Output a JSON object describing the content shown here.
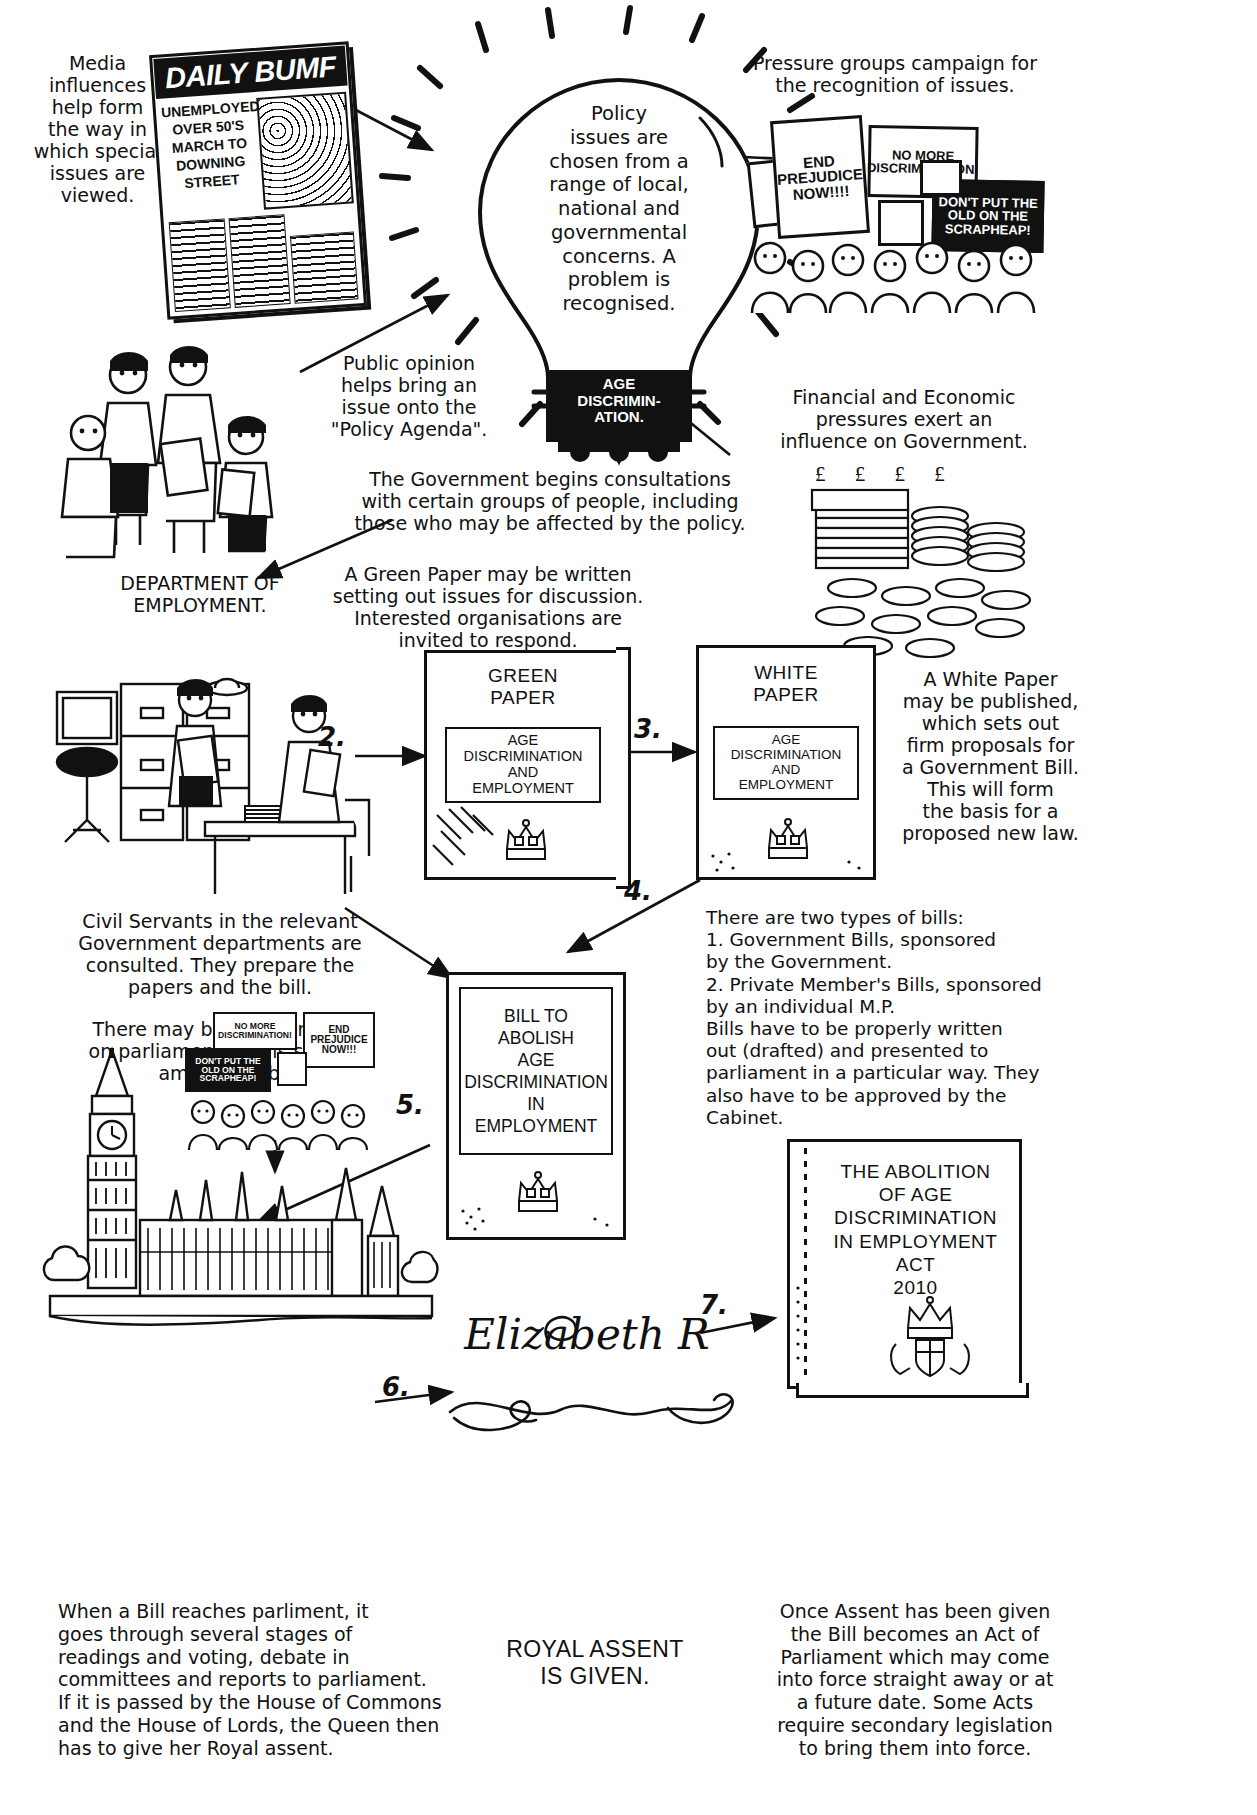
{
  "annotations": {
    "media": "Media\ninfluences\nhelp form\nthe way in\nwhich special\nissues are\nviewed.",
    "pressure_groups": "Pressure groups campaign for\nthe recognition of issues.",
    "public_opinion": "Public opinion\nhelps bring an\nissue onto the\n\"Policy Agenda\".",
    "financial": "Financial and Economic\npressures exert an\ninfluence on Government.",
    "dept_employment": "DEPARTMENT OF\nEMPLOYMENT.",
    "consultations": "The Government begins consultations\nwith certain groups of people, including\nthose who may be affected by the policy.",
    "green_paper_note": "A Green Paper may be written\nsetting out issues for discussion.\nInterested organisations are\ninvited to respond.",
    "white_paper_note": "A White Paper\nmay be published,\nwhich sets out\nfirm proposals for\na Government Bill.\nThis will form\nthe basis for a\nproposed new law.",
    "civil_servants": "Civil Servants in the relevant\nGovernment departments are\nconsulted. They prepare the\npapers and the bill.",
    "more_pressure": "There may be more pressure\non parliament at this stage to\namend the bill.",
    "types_of_bills": "There are two types of bills:\n1. Government Bills, sponsored\nby the Government.\n2. Private Member's Bills, sponsored\nby an individual M.P.\nBills have to be properly written\nout (drafted) and presented to\nparliament in a particular way. They\nalso have to be approved by the\nCabinet.",
    "parliament_stages": "When a Bill reaches parliment, it\ngoes through several stages of\nreadings and voting, debate in\ncommittees and reports to parliament.\nIf it is passed by the House of Commons\nand the House of Lords, the Queen then\nhas to give her Royal assent.",
    "royal_assent_caption": "ROYAL ASSENT\nIS GIVEN.",
    "after_assent": "Once Assent has been given\nthe Bill becomes an Act of\nParliament which may come\ninto force straight away or at\na future date. Some Acts\nrequire secondary legislation\nto bring them into force."
  },
  "lightbulb": {
    "body_text": "Policy\nissues are\nchosen from a\nrange of local,\nnational and\ngovernmental\nconcerns. A\nproblem is\nrecognised.",
    "base_text": "AGE\nDISCRIMIN-\nATION."
  },
  "newspaper": {
    "masthead": "DAILY BUMF",
    "headline": "UNEMPLOYED\nOVER 50'S\nMARCH TO\nDOWNING\nSTREET"
  },
  "protest_signs_top": [
    {
      "text": "END\nPREJUDICE\nNOW!!!!",
      "style": "white"
    },
    {
      "text": "NO MORE\nDISCRIMINATION!",
      "style": "white"
    },
    {
      "text": "DON'T PUT THE\nOLD ON THE\nSCRAPHEAP!",
      "style": "black"
    }
  ],
  "protest_signs_bottom": [
    {
      "text": "NO MORE\nDISCRIMINATION!",
      "style": "white"
    },
    {
      "text": "END\nPREJUDICE\nNOW!!!",
      "style": "white"
    },
    {
      "text": "DON'T PUT THE\nOLD ON THE\nSCRAPHEAP!",
      "style": "black"
    }
  ],
  "documents": {
    "green_paper": {
      "title": "GREEN\nPAPER",
      "subject": "AGE\nDISCRIMINATION\nAND\nEMPLOYMENT"
    },
    "white_paper": {
      "title": "WHITE\nPAPER",
      "subject": "AGE\nDISCRIMINATION\nAND\nEMPLOYMENT"
    },
    "bill": {
      "title": "BILL TO\nABOLISH\nAGE\nDISCRIMINATION\nIN\nEMPLOYMENT"
    },
    "act": {
      "title": "THE ABOLITION\nOF AGE\nDISCRIMINATION\nIN EMPLOYMENT\nACT\n2010"
    }
  },
  "currency_symbols": "£ £ £ £ £ £ £",
  "signature": "Elizabeth R",
  "step_numbers": [
    "1.",
    "2.",
    "3.",
    "4.",
    "5.",
    "6.",
    "7."
  ],
  "colors": {
    "ink": "#111111",
    "paper": "#ffffff"
  }
}
